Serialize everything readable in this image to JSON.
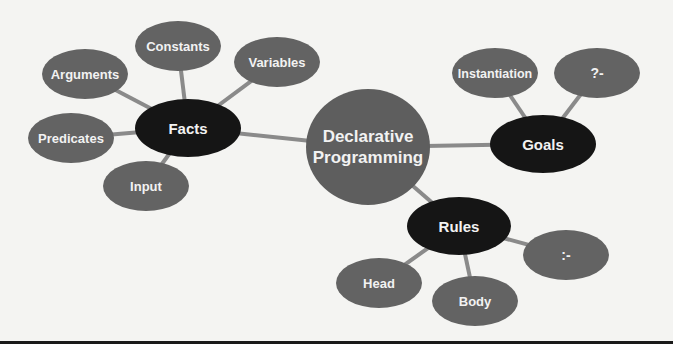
{
  "diagram": {
    "type": "mind-map",
    "colors": {
      "background": "#f4f4f2",
      "primary_node": "#5e5e5e",
      "category_node": "#151515",
      "leaf_node": "#636363",
      "connector": "#8a8a8a",
      "label": "#f2f2f2"
    },
    "center": {
      "label_line1": "Declarative",
      "label_line2": "Programming"
    },
    "facts": {
      "label": "Facts",
      "children": {
        "constants": "Constants",
        "arguments": "Arguments",
        "variables": "Variables",
        "predicates": "Predicates",
        "input": "Input"
      }
    },
    "goals": {
      "label": "Goals",
      "children": {
        "instantiation": "Instantiation",
        "query_operator": "?-"
      }
    },
    "rules": {
      "label": "Rules",
      "children": {
        "neck_operator": ":-",
        "head": "Head",
        "body": "Body"
      }
    }
  }
}
